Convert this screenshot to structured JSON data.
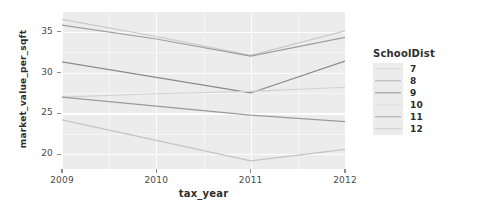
{
  "chart_data": {
    "type": "line",
    "title": "",
    "xlabel": "tax_year",
    "ylabel": "market_value_per_sqft",
    "x": [
      2009,
      2010,
      2011,
      2012
    ],
    "xtick_labels": [
      "2009",
      "2010",
      "2011",
      "2012"
    ],
    "ytick_labels": [
      "20",
      "25",
      "30",
      "35"
    ],
    "ytick_values": [
      20,
      25,
      30,
      35
    ],
    "xlim": [
      2009,
      2012
    ],
    "ylim": [
      18.2,
      37.4
    ],
    "grid": true,
    "grid_color": "#ffffff",
    "panel_background": "#ececec",
    "legend": {
      "title": "SchoolDist",
      "position": "right",
      "entries": [
        {
          "label": "7",
          "color": "#d6d6d6"
        },
        {
          "label": "8",
          "color": "#b3b3b3"
        },
        {
          "label": "9",
          "color": "#8f8f8f"
        },
        {
          "label": "10",
          "color": "#e0e0e0"
        },
        {
          "label": "11",
          "color": "#a8a8a8"
        },
        {
          "label": "12",
          "color": "#cccccc"
        }
      ]
    },
    "series": [
      {
        "name": "7",
        "color": "#c9c9c9",
        "values": [
          36.5,
          34.4,
          32.1,
          35.1
        ]
      },
      {
        "name": "8",
        "color": "#9e9e9e",
        "values": [
          35.8,
          34.1,
          32.0,
          34.3
        ]
      },
      {
        "name": "9",
        "color": "#8a8a8a",
        "values": [
          31.3,
          29.4,
          27.5,
          31.4
        ]
      },
      {
        "name": "10",
        "color": "#d2d2d2",
        "values": [
          27.0,
          27.4,
          27.7,
          28.2
        ]
      },
      {
        "name": "11",
        "color": "#9a9a9a",
        "values": [
          27.0,
          25.9,
          24.8,
          24.0
        ]
      },
      {
        "name": "12",
        "color": "#c4c4c4",
        "values": [
          24.2,
          21.7,
          19.2,
          20.6
        ]
      }
    ]
  }
}
